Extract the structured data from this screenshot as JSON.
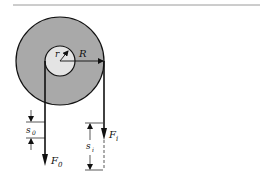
{
  "diagram": {
    "type": "wheel-and-axle",
    "colors": {
      "wheel_fill": "#a9a9a9",
      "axle_fill": "#e4e4e4",
      "stroke": "#111111",
      "rule": "#9a9a9a",
      "background": "#ffffff"
    },
    "labels": {
      "inner_radius": "r",
      "outer_radius": "R",
      "output_force": "F",
      "output_force_sub": "0",
      "input_force": "F",
      "input_force_sub": "i",
      "output_displacement": "s",
      "output_displacement_sub": "0",
      "input_displacement": "s",
      "input_displacement_sub": "i"
    }
  }
}
